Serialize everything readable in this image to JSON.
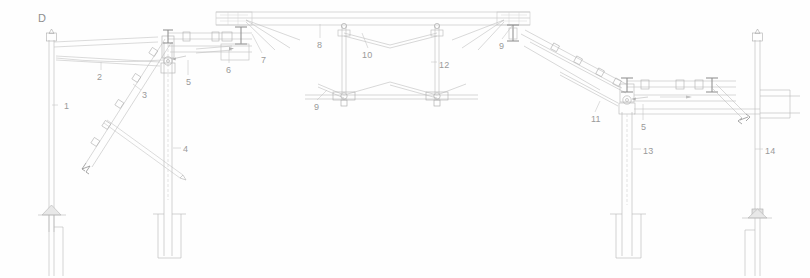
{
  "drawing": {
    "detail_tag": "D",
    "title": "Structural canopy elevation — detail D",
    "type": "technical-line-drawing",
    "background_color": "#fefefe",
    "line_color": "#b9b9b9",
    "line_color_dark": "#8f8f8f",
    "label_color": "#9a9a9a"
  },
  "callouts": [
    {
      "id": "1",
      "text": "1",
      "x": 64,
      "y": 101,
      "leader": {
        "x1": 58,
        "y1": 105,
        "x2": 52,
        "y2": 105
      }
    },
    {
      "id": "2",
      "text": "2",
      "x": 97,
      "y": 72,
      "leader": {
        "x1": 101,
        "y1": 70,
        "x2": 101,
        "y2": 62
      }
    },
    {
      "id": "3",
      "text": "3",
      "x": 142,
      "y": 90,
      "leader": {
        "x1": 141,
        "y1": 90,
        "x2": 133,
        "y2": 84
      }
    },
    {
      "id": "4",
      "text": "4",
      "x": 183,
      "y": 144,
      "leader": {
        "x1": 181,
        "y1": 148,
        "x2": 173,
        "y2": 148
      }
    },
    {
      "id": "5",
      "text": "5",
      "x": 186,
      "y": 77,
      "leader": {
        "x1": 188,
        "y1": 75,
        "x2": 188,
        "y2": 60
      }
    },
    {
      "id": "6",
      "text": "6",
      "x": 226,
      "y": 65,
      "leader": {
        "x1": 229,
        "y1": 63,
        "x2": 229,
        "y2": 50
      }
    },
    {
      "id": "7",
      "text": "7",
      "x": 261,
      "y": 55,
      "leader": {
        "x1": 262,
        "y1": 53,
        "x2": 252,
        "y2": 34
      }
    },
    {
      "id": "8",
      "text": "8",
      "x": 317,
      "y": 40,
      "leader": {
        "x1": 320,
        "y1": 38,
        "x2": 320,
        "y2": 24
      }
    },
    {
      "id": "9a",
      "text": "9",
      "x": 314,
      "y": 102,
      "leader": {
        "x1": 317,
        "y1": 100,
        "x2": 327,
        "y2": 90
      }
    },
    {
      "id": "9b",
      "text": "9",
      "x": 499,
      "y": 41,
      "leader": {
        "x1": 502,
        "y1": 39,
        "x2": 512,
        "y2": 26
      }
    },
    {
      "id": "10",
      "text": "10",
      "x": 362,
      "y": 50,
      "leader": {
        "x1": 368,
        "y1": 48,
        "x2": 362,
        "y2": 33
      }
    },
    {
      "id": "11",
      "text": "11",
      "x": 591,
      "y": 114,
      "leader": {
        "x1": 595,
        "y1": 112,
        "x2": 600,
        "y2": 101
      }
    },
    {
      "id": "12",
      "text": "12",
      "x": 439,
      "y": 60,
      "leader": {
        "x1": 437,
        "y1": 62,
        "x2": 431,
        "y2": 62
      }
    },
    {
      "id": "5b",
      "text": "5",
      "x": 641,
      "y": 122,
      "leader": {
        "x1": 643,
        "y1": 120,
        "x2": 643,
        "y2": 104
      }
    },
    {
      "id": "13",
      "text": "13",
      "x": 643,
      "y": 146,
      "leader": {
        "x1": 641,
        "y1": 149,
        "x2": 633,
        "y2": 149
      }
    },
    {
      "id": "14",
      "text": "14",
      "x": 765,
      "y": 146,
      "leader": {
        "x1": 763,
        "y1": 149,
        "x2": 755,
        "y2": 149
      }
    }
  ]
}
